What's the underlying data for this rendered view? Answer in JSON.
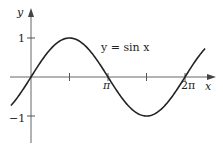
{
  "chart_data": {
    "type": "line",
    "title": "",
    "annotation": "y = sin x",
    "xlabel": "x",
    "ylabel": "y",
    "x_ticks": [
      {
        "value": 1.5708,
        "label": ""
      },
      {
        "value": 3.1416,
        "label": "π"
      },
      {
        "value": 4.7124,
        "label": ""
      },
      {
        "value": 6.2832,
        "label": "2π"
      }
    ],
    "y_ticks": [
      {
        "value": 1,
        "label": "1"
      },
      {
        "value": -1,
        "label": "−1"
      }
    ],
    "xlim": [
      -0.82,
      7.1
    ],
    "ylim": [
      -1.7,
      1.7
    ],
    "grid": false,
    "series": [
      {
        "name": "y = sin x",
        "function": "sin(x)",
        "x_range": [
          -0.82,
          7.1
        ]
      }
    ]
  },
  "labels": {
    "annotation": "y = sin x",
    "x_axis": "x",
    "y_axis": "y",
    "pi": "π",
    "two_pi": "2π",
    "one": "1",
    "minus_one": "−1"
  },
  "colors": {
    "axis": "#555555",
    "curve": "#222222"
  }
}
